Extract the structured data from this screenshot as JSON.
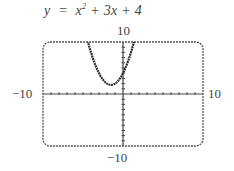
{
  "equation": {
    "lhs": "y",
    "rhs_pre": "x",
    "exponent": "2",
    "rhs_post": " + 3x + 4"
  },
  "labels": {
    "ymax": "10",
    "ymin": "−10",
    "xmin": "−10",
    "xmax": "10"
  },
  "chart_data": {
    "type": "line",
    "function": "x^2 + 3x + 4",
    "xlim": [
      -10,
      10
    ],
    "ylim": [
      -10,
      10
    ],
    "xscale_ticks": 1,
    "yscale_ticks": 1,
    "grid": false,
    "vertex": [
      -1.5,
      1.75
    ],
    "y_intercept": 4,
    "x": [
      -6,
      -5,
      -4,
      -3,
      -2,
      -1.5,
      -1,
      0,
      1,
      2
    ],
    "y": [
      22,
      14,
      8,
      4,
      2,
      1.75,
      2,
      4,
      8,
      14
    ],
    "tick_labels": {
      "x": [
        "-10",
        "10"
      ],
      "y": [
        "-10",
        "10"
      ]
    },
    "xlabel": "",
    "ylabel": ""
  }
}
